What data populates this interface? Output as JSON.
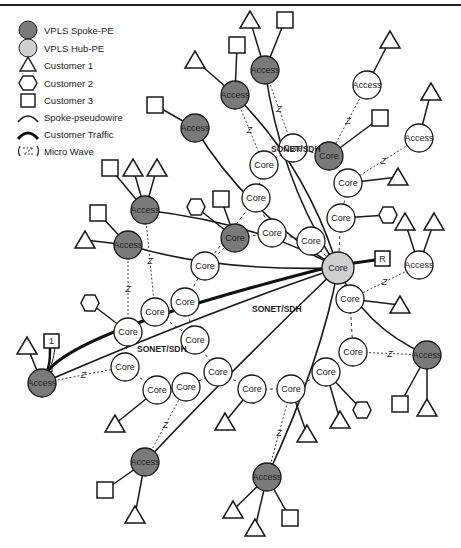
{
  "legend": {
    "items": [
      {
        "key": "spoke_pe",
        "label": "VPLS Spoke-PE",
        "icon": "dark-circle-icon"
      },
      {
        "key": "hub_pe",
        "label": "VPLS Hub-PE",
        "icon": "light-circle-icon"
      },
      {
        "key": "customer1",
        "label": "Customer 1",
        "icon": "triangle-icon"
      },
      {
        "key": "customer2",
        "label": "Customer 2",
        "icon": "hexagon-icon"
      },
      {
        "key": "customer3",
        "label": "Customer 3",
        "icon": "square-icon"
      },
      {
        "key": "spoke_pw",
        "label": "Spoke-pseudowire",
        "icon": "thin-arc-icon"
      },
      {
        "key": "cust_traffic",
        "label": "Customer Traffic",
        "icon": "thick-arc-icon"
      },
      {
        "key": "microwave",
        "label": "Micro Wave",
        "icon": "microwave-icon"
      }
    ]
  },
  "colors": {
    "spoke_pe": "#7a7a7a",
    "hub_pe": "#cfcfcf",
    "core": "#ffffff",
    "stroke": "#1a1a1a"
  },
  "labels": {
    "sonet": [
      "SONET/SDH",
      "SONET/SDH",
      "SONET/SDH"
    ],
    "router_r": "R",
    "router_1": "1"
  },
  "hub": {
    "x": 338,
    "y": 268,
    "label": "Core"
  },
  "nodes": [
    {
      "id": "a1",
      "x": 265,
      "y": 70,
      "type": "spoke",
      "label": "Access"
    },
    {
      "id": "a2",
      "x": 235,
      "y": 95,
      "type": "spoke",
      "label": "Access"
    },
    {
      "id": "a3",
      "x": 195,
      "y": 128,
      "type": "spoke",
      "label": "Access"
    },
    {
      "id": "a4",
      "x": 145,
      "y": 210,
      "type": "spoke",
      "label": "Access"
    },
    {
      "id": "a5",
      "x": 128,
      "y": 245,
      "type": "spoke",
      "label": "Access"
    },
    {
      "id": "a6",
      "x": 42,
      "y": 383,
      "type": "spoke",
      "label": "Access"
    },
    {
      "id": "a7",
      "x": 145,
      "y": 462,
      "type": "spoke",
      "label": "Access"
    },
    {
      "id": "a8",
      "x": 267,
      "y": 477,
      "type": "spoke",
      "label": "Access"
    },
    {
      "id": "a9",
      "x": 427,
      "y": 355,
      "type": "spoke",
      "label": "Access"
    },
    {
      "id": "ax1",
      "x": 367,
      "y": 85,
      "type": "access",
      "label": "Access"
    },
    {
      "id": "ax2",
      "x": 419,
      "y": 138,
      "type": "access",
      "label": "Access"
    },
    {
      "id": "ax3",
      "x": 419,
      "y": 265,
      "type": "access",
      "label": "Access"
    },
    {
      "id": "c1",
      "x": 293,
      "y": 148,
      "type": "core",
      "label": "Core"
    },
    {
      "id": "c2",
      "x": 329,
      "y": 156,
      "type": "spoke",
      "label": "Core"
    },
    {
      "id": "c3",
      "x": 264,
      "y": 165,
      "type": "core",
      "label": "Core"
    },
    {
      "id": "c4",
      "x": 348,
      "y": 183,
      "type": "core",
      "label": "Core"
    },
    {
      "id": "c5",
      "x": 341,
      "y": 218,
      "type": "core",
      "label": "Core"
    },
    {
      "id": "c6",
      "x": 256,
      "y": 198,
      "type": "core",
      "label": "Core"
    },
    {
      "id": "c7",
      "x": 235,
      "y": 238,
      "type": "spoke",
      "label": "Core"
    },
    {
      "id": "c8",
      "x": 272,
      "y": 233,
      "type": "core",
      "label": "Core"
    },
    {
      "id": "c9",
      "x": 311,
      "y": 241,
      "type": "core",
      "label": "Core"
    },
    {
      "id": "c10",
      "x": 205,
      "y": 266,
      "type": "core",
      "label": "Core"
    },
    {
      "id": "c11",
      "x": 185,
      "y": 302,
      "type": "core",
      "label": "Core"
    },
    {
      "id": "c12",
      "x": 155,
      "y": 312,
      "type": "core",
      "label": "Core"
    },
    {
      "id": "c13",
      "x": 128,
      "y": 332,
      "type": "core",
      "label": "Core"
    },
    {
      "id": "c14",
      "x": 195,
      "y": 340,
      "type": "core",
      "label": "Core"
    },
    {
      "id": "c15",
      "x": 125,
      "y": 367,
      "type": "core",
      "label": "Core"
    },
    {
      "id": "c16",
      "x": 157,
      "y": 390,
      "type": "core",
      "label": "Core"
    },
    {
      "id": "c17",
      "x": 186,
      "y": 387,
      "type": "core",
      "label": "Core"
    },
    {
      "id": "c18",
      "x": 218,
      "y": 372,
      "type": "core",
      "label": "Core"
    },
    {
      "id": "c19",
      "x": 252,
      "y": 389,
      "type": "core",
      "label": "Core"
    },
    {
      "id": "c20",
      "x": 291,
      "y": 389,
      "type": "core",
      "label": "Core"
    },
    {
      "id": "c21",
      "x": 326,
      "y": 372,
      "type": "core",
      "label": "Core"
    },
    {
      "id": "c22",
      "x": 353,
      "y": 352,
      "type": "core",
      "label": "Core"
    },
    {
      "id": "c23",
      "x": 350,
      "y": 299,
      "type": "core",
      "label": "Core"
    }
  ],
  "customers": [
    {
      "shape": "tri",
      "x": 250,
      "y": 20,
      "to": "a1"
    },
    {
      "shape": "sq",
      "x": 285,
      "y": 20,
      "to": "a1"
    },
    {
      "shape": "tri",
      "x": 195,
      "y": 60,
      "to": "a2"
    },
    {
      "shape": "sq",
      "x": 237,
      "y": 45,
      "to": "a2"
    },
    {
      "shape": "sq",
      "x": 155,
      "y": 105,
      "to": "a3"
    },
    {
      "shape": "tri",
      "x": 390,
      "y": 40,
      "to": "ax1"
    },
    {
      "shape": "tri",
      "x": 431,
      "y": 92,
      "to": "ax2"
    },
    {
      "shape": "sq",
      "x": 380,
      "y": 118,
      "to": "c2"
    },
    {
      "shape": "tri",
      "x": 398,
      "y": 177,
      "to": "c4"
    },
    {
      "shape": "hex",
      "x": 388,
      "y": 215,
      "to": "c5"
    },
    {
      "shape": "sq",
      "x": 110,
      "y": 168,
      "to": "a4"
    },
    {
      "shape": "tri",
      "x": 133,
      "y": 168,
      "to": "a4"
    },
    {
      "shape": "tri",
      "x": 157,
      "y": 168,
      "to": "a4"
    },
    {
      "shape": "sq",
      "x": 98,
      "y": 213,
      "to": "a5"
    },
    {
      "shape": "tri",
      "x": 85,
      "y": 240,
      "to": "a5"
    },
    {
      "shape": "hex",
      "x": 196,
      "y": 207,
      "to": "c7"
    },
    {
      "shape": "sq",
      "x": 221,
      "y": 199,
      "to": "c7"
    },
    {
      "shape": "tri",
      "x": 405,
      "y": 222,
      "to": "ax3"
    },
    {
      "shape": "tri",
      "x": 434,
      "y": 222,
      "to": "ax3"
    },
    {
      "shape": "tri",
      "x": 400,
      "y": 305,
      "to": "c23"
    },
    {
      "shape": "hex",
      "x": 90,
      "y": 303,
      "to": "c13"
    },
    {
      "shape": "tri",
      "x": 27,
      "y": 346,
      "to": "a6"
    },
    {
      "shape": "tri",
      "x": 115,
      "y": 424,
      "to": "c16"
    },
    {
      "shape": "tri",
      "x": 225,
      "y": 422,
      "to": "c19"
    },
    {
      "shape": "tri",
      "x": 307,
      "y": 434,
      "to": "c20"
    },
    {
      "shape": "hex",
      "x": 362,
      "y": 410,
      "to": "c21"
    },
    {
      "shape": "tri",
      "x": 340,
      "y": 420,
      "to": "c21"
    },
    {
      "shape": "sq",
      "x": 400,
      "y": 404,
      "to": "a9"
    },
    {
      "shape": "tri",
      "x": 427,
      "y": 408,
      "to": "a9"
    },
    {
      "shape": "sq",
      "x": 105,
      "y": 490,
      "to": "a7"
    },
    {
      "shape": "tri",
      "x": 135,
      "y": 515,
      "to": "a7"
    },
    {
      "shape": "tri",
      "x": 233,
      "y": 510,
      "to": "a8"
    },
    {
      "shape": "tri",
      "x": 255,
      "y": 528,
      "to": "a8"
    },
    {
      "shape": "sq",
      "x": 290,
      "y": 518,
      "to": "a8"
    }
  ]
}
